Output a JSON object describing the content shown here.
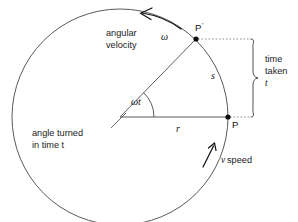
{
  "figure": {
    "background_color": "#ffffff",
    "line_color": "#3b3b3b",
    "dotted_color": "#8e8e8e",
    "text_color": "#1a1a1a"
  },
  "labels": {
    "angular_velocity_line1": "angular",
    "angular_velocity_line2": "velocity",
    "omega": "ω",
    "omega_t": "ωt",
    "radius": "r",
    "arc": "s",
    "point_p": "P",
    "point_p_prime": "P",
    "point_p_prime_mark": "'",
    "time_taken_line1": "time",
    "time_taken_line2": "taken",
    "time_taken_line3": "t",
    "angle_turned_line1": "angle turned",
    "angle_turned_line2": "in time t",
    "v_speed": "v speed",
    "v_symbol": "v",
    "speed_word": " speed"
  },
  "geometry": {
    "center_x": 120,
    "center_y": 117,
    "radius": 108,
    "p_x": 228,
    "p_y": 117,
    "p_prime_x": 196,
    "p_prime_y": 39,
    "angle_degrees": 45.7,
    "angle_arc_radius": 34,
    "dotted_right_x": 252,
    "brace_x": 255
  },
  "annotations": {
    "omega_arrow_direction": "counterclockwise",
    "v_arrow_direction": "tangential-upward",
    "bracket_spans": "vertical displacement from P to P-prime"
  },
  "icons": {
    "omega_arrow": "curved-arrow-icon",
    "v_arrow": "tangent-arrow-icon",
    "brace": "curly-brace-icon"
  }
}
